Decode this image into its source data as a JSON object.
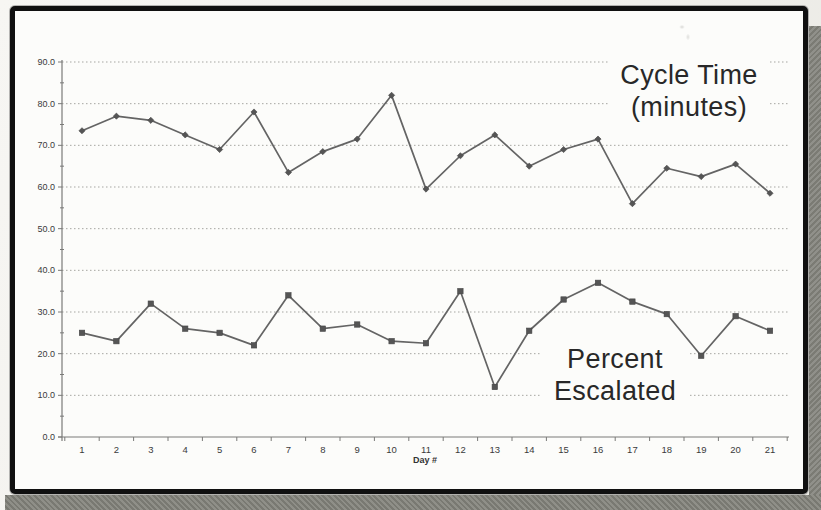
{
  "chart_data": {
    "type": "line",
    "title": "",
    "xlabel": "Day #",
    "ylabel": "",
    "x": [
      1,
      2,
      3,
      4,
      5,
      6,
      7,
      8,
      9,
      10,
      11,
      12,
      13,
      14,
      15,
      16,
      17,
      18,
      19,
      20,
      21
    ],
    "xticks": [
      "1",
      "2",
      "3",
      "4",
      "5",
      "6",
      "7",
      "8",
      "9",
      "10",
      "11",
      "12",
      "13",
      "14",
      "15",
      "16",
      "17",
      "18",
      "19",
      "20",
      "21"
    ],
    "yticks": [
      "0.0",
      "10.0",
      "20.0",
      "30.0",
      "40.0",
      "50.0",
      "60.0",
      "70.0",
      "80.0",
      "90.0"
    ],
    "ylim": [
      0,
      90
    ],
    "ytick_step": 10,
    "grid": "horizontal-dotted",
    "legend_position": "none",
    "series": [
      {
        "name": "Cycle Time (minutes)",
        "marker": "diamond",
        "values": [
          73.5,
          77,
          76,
          72.5,
          69,
          78,
          63.5,
          68.5,
          71.5,
          82,
          59.5,
          67.5,
          72.5,
          65,
          69,
          71.5,
          56,
          64.5,
          62.5,
          65.5,
          58.5
        ]
      },
      {
        "name": "Percent Escalated",
        "marker": "square",
        "values": [
          25,
          23,
          32,
          26,
          25,
          22,
          34,
          26,
          27,
          23,
          22.5,
          35,
          12,
          25.5,
          33,
          37,
          32.5,
          29.5,
          19.5,
          29,
          25.5
        ]
      }
    ],
    "annotations": [
      {
        "name": "cycle-time-label",
        "lines": [
          "Cycle Time",
          "(minutes)"
        ]
      },
      {
        "name": "percent-escalated-label",
        "lines": [
          "Percent",
          "Escalated"
        ]
      }
    ]
  },
  "colors": {
    "line": "#646464",
    "marker_fill": "#555555",
    "marker_stroke": "#454545",
    "grid": "#a6a6a2",
    "axis": "#7a7a78",
    "tick_text": "#3a3a3a",
    "annotation_text": "#282828",
    "frame": "#101010",
    "paper": "#fcfcfa",
    "page_bg": "#f2f1ed",
    "shadow": "#85857e"
  }
}
